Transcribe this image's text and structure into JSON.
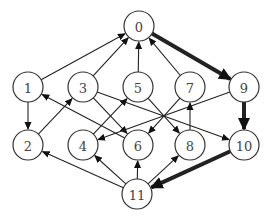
{
  "diagram": {
    "type": "directed-graph",
    "node_radius": 15,
    "nodes": [
      {
        "id": "0",
        "label": "0",
        "x": 139,
        "y": 26
      },
      {
        "id": "1",
        "label": "1",
        "x": 28,
        "y": 87
      },
      {
        "id": "3",
        "label": "3",
        "x": 83,
        "y": 87
      },
      {
        "id": "5",
        "label": "5",
        "x": 138,
        "y": 87
      },
      {
        "id": "7",
        "label": "7",
        "x": 190,
        "y": 87
      },
      {
        "id": "9",
        "label": "9",
        "x": 244,
        "y": 87
      },
      {
        "id": "2",
        "label": "2",
        "x": 28,
        "y": 145
      },
      {
        "id": "4",
        "label": "4",
        "x": 83,
        "y": 145
      },
      {
        "id": "6",
        "label": "6",
        "x": 138,
        "y": 145
      },
      {
        "id": "8",
        "label": "8",
        "x": 190,
        "y": 145
      },
      {
        "id": "10",
        "label": "10",
        "x": 244,
        "y": 145
      },
      {
        "id": "11",
        "label": "11",
        "x": 137,
        "y": 194
      }
    ],
    "edges": [
      {
        "from": "1",
        "to": "0",
        "thick": false
      },
      {
        "from": "3",
        "to": "0",
        "thick": false
      },
      {
        "from": "5",
        "to": "0",
        "thick": false
      },
      {
        "from": "7",
        "to": "0",
        "thick": false
      },
      {
        "from": "0",
        "to": "9",
        "thick": true
      },
      {
        "from": "1",
        "to": "2",
        "thick": false
      },
      {
        "from": "2",
        "to": "3",
        "thick": false
      },
      {
        "from": "6",
        "to": "1",
        "thick": false
      },
      {
        "from": "3",
        "to": "6",
        "thick": false
      },
      {
        "from": "3",
        "to": "10",
        "thick": false
      },
      {
        "from": "4",
        "to": "5",
        "thick": false
      },
      {
        "from": "5",
        "to": "8",
        "thick": false
      },
      {
        "from": "7",
        "to": "6",
        "thick": false
      },
      {
        "from": "9",
        "to": "4",
        "thick": false
      },
      {
        "from": "8",
        "to": "7",
        "thick": false
      },
      {
        "from": "9",
        "to": "10",
        "thick": true
      },
      {
        "from": "10",
        "to": "11",
        "thick": true
      },
      {
        "from": "11",
        "to": "2",
        "thick": false
      },
      {
        "from": "11",
        "to": "4",
        "thick": false
      },
      {
        "from": "11",
        "to": "6",
        "thick": false
      },
      {
        "from": "11",
        "to": "8",
        "thick": false
      }
    ]
  }
}
